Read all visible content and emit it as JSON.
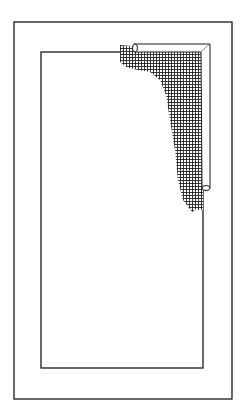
{
  "illustration": {
    "subject": "window-frame-with-mesh-screen-corner",
    "colors": {
      "line": "#1a1a1a",
      "background": "#ffffff"
    }
  }
}
